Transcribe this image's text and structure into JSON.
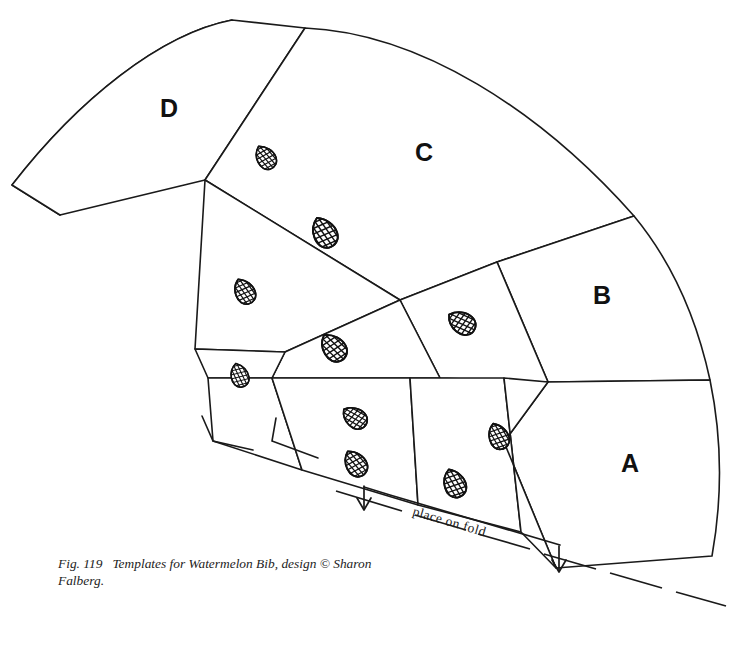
{
  "figure": {
    "caption_label": "Fig. 119",
    "caption_text": "Templates for Watermelon Bib, design © Sharon Falberg.",
    "title": "Templates for Watermelon Bib",
    "designer": "Sharon Falberg",
    "copyright_symbol": "©",
    "background_color": "#ffffff",
    "line_color": "#1a1a1a"
  },
  "panels": [
    {
      "id": "A",
      "label": "A",
      "label_x": 630,
      "label_y": 472
    },
    {
      "id": "B",
      "label": "B",
      "label_x": 602,
      "label_y": 304
    },
    {
      "id": "C",
      "label": "C",
      "label_x": 424,
      "label_y": 161
    },
    {
      "id": "D",
      "label": "D",
      "label_x": 169,
      "label_y": 117
    }
  ],
  "fold": {
    "label": "place on fold",
    "label_x": 460,
    "label_y": 527,
    "label_rotation": 16.5
  },
  "seeds": [
    {
      "x": 266,
      "y": 157,
      "rotation": -35,
      "scale": 1.0
    },
    {
      "x": 325,
      "y": 232,
      "rotation": -30,
      "scale": 1.25
    },
    {
      "x": 245,
      "y": 291,
      "rotation": -30,
      "scale": 1.05
    },
    {
      "x": 240,
      "y": 375,
      "rotation": -20,
      "scale": 0.95
    },
    {
      "x": 334,
      "y": 347,
      "rotation": -40,
      "scale": 1.2
    },
    {
      "x": 462,
      "y": 322,
      "rotation": -60,
      "scale": 1.15
    },
    {
      "x": 355,
      "y": 417,
      "rotation": -55,
      "scale": 1.05
    },
    {
      "x": 356,
      "y": 463,
      "rotation": -35,
      "scale": 1.1
    },
    {
      "x": 499,
      "y": 436,
      "rotation": -25,
      "scale": 1.05
    },
    {
      "x": 455,
      "y": 483,
      "rotation": -25,
      "scale": 1.15
    }
  ],
  "colors": {
    "ink": "#1a1a1a",
    "paper": "#ffffff"
  }
}
